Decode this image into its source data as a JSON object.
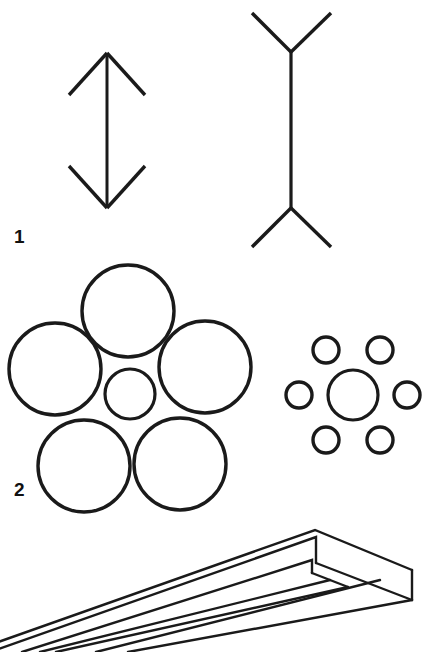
{
  "sheet": {
    "width": 427,
    "height": 652,
    "background": "#ffffff",
    "ink": "#1a1a1a"
  },
  "figures": [
    {
      "id": "figure-1",
      "number": "1",
      "name": "muller-lyer-illusion",
      "label_pos": {
        "x": 14,
        "y": 243
      },
      "elements": [
        {
          "name": "double-headed-arrow-outward-fins",
          "shaft": {
            "x1": 107,
            "y1": 53,
            "x2": 107,
            "y2": 208
          },
          "fins": [
            {
              "x1": 69,
              "y1": 95,
              "x2": 107,
              "y2": 53
            },
            {
              "x1": 107,
              "y1": 53,
              "x2": 145,
              "y2": 95
            },
            {
              "x1": 69,
              "y1": 166,
              "x2": 107,
              "y2": 208
            },
            {
              "x1": 107,
              "y1": 208,
              "x2": 145,
              "y2": 166
            }
          ]
        },
        {
          "name": "double-headed-arrow-inward-fins",
          "shaft": {
            "x1": 291,
            "y1": 52,
            "x2": 291,
            "y2": 208
          },
          "fins": [
            {
              "x1": 253,
              "y1": 13,
              "x2": 291,
              "y2": 52
            },
            {
              "x1": 291,
              "y1": 52,
              "x2": 330,
              "y2": 13
            },
            {
              "x1": 253,
              "y1": 246,
              "x2": 291,
              "y2": 208
            },
            {
              "x1": 291,
              "y1": 208,
              "x2": 330,
              "y2": 246
            }
          ]
        }
      ]
    },
    {
      "id": "figure-2",
      "number": "2",
      "name": "ebbinghaus-illusion",
      "label_pos": {
        "x": 14,
        "y": 496
      },
      "groups": [
        {
          "name": "center-circle-with-large-flankers",
          "center": {
            "cx": 130,
            "cy": 394,
            "r": 25
          },
          "flankers": [
            {
              "cx": 128,
              "cy": 310,
              "r": 46
            },
            {
              "cx": 55,
              "cy": 369,
              "r": 46
            },
            {
              "cx": 205,
              "cy": 367,
              "r": 46
            },
            {
              "cx": 84,
              "cy": 465,
              "r": 46
            },
            {
              "cx": 180,
              "cy": 463,
              "r": 46
            }
          ]
        },
        {
          "name": "center-circle-with-small-flankers",
          "center": {
            "cx": 353,
            "cy": 395,
            "r": 25
          },
          "flankers": [
            {
              "cx": 326,
              "cy": 350,
              "r": 13
            },
            {
              "cx": 380,
              "cy": 350,
              "r": 13
            },
            {
              "cx": 299,
              "cy": 395,
              "r": 13
            },
            {
              "cx": 407,
              "cy": 395,
              "r": 13
            },
            {
              "cx": 326,
              "cy": 440,
              "r": 13
            },
            {
              "cx": 380,
              "cy": 440,
              "r": 13
            }
          ]
        }
      ]
    },
    {
      "id": "figure-3",
      "number": "",
      "name": "impossible-fork-blivet",
      "description": "three-dimensional impossible prong object drawn in line art"
    }
  ],
  "stroke_widths": {
    "arrow": 3,
    "circle_large": 3.2,
    "circle_small": 3.2,
    "object": 2.4
  }
}
